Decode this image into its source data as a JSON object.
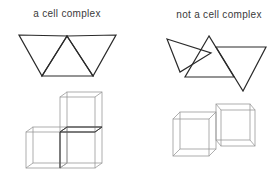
{
  "panels": {
    "left": {
      "title": "a cell complex",
      "triangles": [
        [
          [
            19,
            35
          ],
          [
            67,
            36
          ],
          [
            42,
            76
          ]
        ],
        [
          [
            67,
            36
          ],
          [
            42,
            76
          ],
          [
            93,
            76
          ]
        ],
        [
          [
            67,
            36
          ],
          [
            116,
            35
          ],
          [
            93,
            76
          ]
        ]
      ],
      "cubes": [
        {
          "front": [
            60,
            97,
            35,
            35
          ],
          "offset": [
            7,
            -5
          ]
        },
        {
          "front": [
            26,
            132,
            34,
            36
          ],
          "offset": [
            7,
            -5
          ]
        },
        {
          "front": [
            60,
            132,
            35,
            36
          ],
          "offset": [
            7,
            -5
          ]
        }
      ],
      "shared_edges": [
        [
          [
            60,
            132
          ],
          [
            95,
            132
          ]
        ],
        [
          [
            60,
            132
          ],
          [
            67,
            127
          ]
        ],
        [
          [
            95,
            132
          ],
          [
            102,
            127
          ]
        ],
        [
          [
            67,
            127
          ],
          [
            102,
            127
          ]
        ],
        [
          [
            60,
            132
          ],
          [
            60,
            168
          ]
        ]
      ]
    },
    "right": {
      "title": "not a cell complex",
      "triangles": [
        [
          [
            167,
            39
          ],
          [
            211,
            53
          ],
          [
            180,
            72
          ]
        ],
        [
          [
            209,
            36
          ],
          [
            185,
            77
          ],
          [
            234,
            77
          ]
        ],
        [
          [
            216,
            47
          ],
          [
            266,
            47
          ],
          [
            243,
            91
          ]
        ]
      ],
      "cubes": [
        {
          "front": [
            173,
            119,
            36,
            37
          ],
          "offset": [
            7,
            -7
          ]
        },
        {
          "front": [
            216,
            104,
            34,
            36
          ],
          "offset": [
            5,
            6
          ]
        }
      ]
    }
  },
  "colors": {
    "background": "#ffffff",
    "text": "#3a3a3a",
    "triangle_stroke": "#2a2a2a",
    "cube_stroke": "#9a9a9a",
    "cube_shared_stroke": "#3a3a3a"
  }
}
